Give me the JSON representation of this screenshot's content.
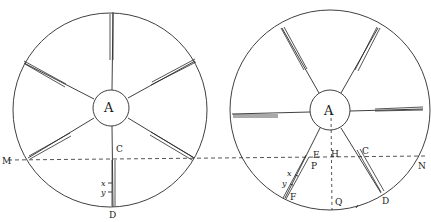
{
  "diagram": {
    "colors": {
      "ink": "#2a2a2a",
      "background": "#ffffff"
    },
    "left_wheel": {
      "hub_label": "A",
      "labels": {
        "M": "M",
        "C": "C",
        "D": "D",
        "x": "x",
        "y": "y"
      }
    },
    "right_wheel": {
      "hub_label": "A",
      "labels": {
        "E": "E",
        "H": "H",
        "C": "C",
        "P": "P",
        "N": "N",
        "x": "x",
        "y": "y",
        "F": "F",
        "Q": "Q",
        "D": "D"
      }
    }
  }
}
